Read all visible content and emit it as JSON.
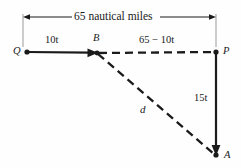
{
  "figure": {
    "title_label": "65 nautical miles",
    "background_color": "#fefefe",
    "stroke_color": "#1a1a1a",
    "dimension_line": {
      "label": "65 nautical miles",
      "value": 65,
      "units": "nautical miles"
    },
    "points": [
      {
        "id": "Q",
        "label": "Q",
        "x": 27,
        "y": 52
      },
      {
        "id": "B",
        "label": "B",
        "x": 97,
        "y": 53
      },
      {
        "id": "P",
        "label": "P",
        "x": 216,
        "y": 52
      },
      {
        "id": "A",
        "label": "A",
        "x": 216,
        "y": 155
      }
    ],
    "segments": [
      {
        "id": "QB",
        "from": "Q",
        "to": "B",
        "label": "10t",
        "style": "solid-arrow",
        "description": "boat travels 10t from Q to B"
      },
      {
        "id": "BP",
        "from": "B",
        "to": "P",
        "label": "65 − 10t",
        "style": "dashed",
        "description": "remaining distance from B to P"
      },
      {
        "id": "PA",
        "from": "P",
        "to": "A",
        "label": "15t",
        "style": "solid-arrow",
        "description": "second boat travels 15t from P to A"
      },
      {
        "id": "BA",
        "from": "B",
        "to": "A",
        "label": "d",
        "style": "dashed",
        "description": "distance d between the two boats"
      }
    ],
    "labels": {
      "segment_qb": "10t",
      "segment_bp": "65 − 10t",
      "segment_pa": "15t",
      "segment_ba": "d",
      "point_q": "Q",
      "point_b": "B",
      "point_p": "P",
      "point_a": "A"
    }
  }
}
